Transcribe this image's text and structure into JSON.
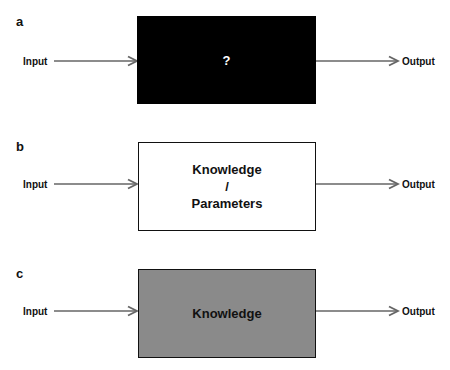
{
  "panels": [
    {
      "label": "a",
      "box_text": "?",
      "box_fill": "#000000",
      "box_text_color": "#ffffff",
      "input": "Input",
      "output": "Output"
    },
    {
      "label": "b",
      "box_text_line1": "Knowledge",
      "box_text_line2": "/",
      "box_text_line3": "Parameters",
      "box_fill": "#ffffff",
      "input": "Input",
      "output": "Output"
    },
    {
      "label": "c",
      "box_text": "Knowledge",
      "box_fill": "#8a8a8a",
      "input": "Input",
      "output": "Output"
    }
  ],
  "colors": {
    "arrow": "#666666",
    "border": "#111111"
  }
}
